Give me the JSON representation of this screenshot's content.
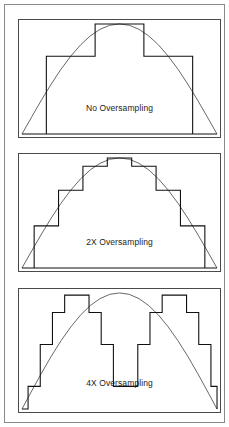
{
  "figure": {
    "background_color": "#ffffff",
    "outer_frame_color": "#8a8a8a",
    "panel_border_color": "#4a4a4a",
    "curve_color": "#555555",
    "staircase_color": "#111111",
    "label_color": "#1c1c1c"
  },
  "panels": [
    {
      "id": "no-oversampling",
      "label": "No Oversampling",
      "steps": 4,
      "step_description": "Coarse 4-step staircase approximating a half-sine arch",
      "chart_data": {
        "type": "area",
        "title": "No Oversampling",
        "xlabel": "",
        "ylabel": "",
        "xlim": [
          0,
          1
        ],
        "ylim": [
          0,
          1
        ],
        "grid": false,
        "legend": "none",
        "curve": {
          "name": "ideal sine arch",
          "x": [
            0.0,
            0.05,
            0.1,
            0.15,
            0.2,
            0.25,
            0.3,
            0.35,
            0.4,
            0.45,
            0.5,
            0.55,
            0.6,
            0.65,
            0.7,
            0.75,
            0.8,
            0.85,
            0.9,
            0.95,
            1.0
          ],
          "y": [
            0.0,
            0.156,
            0.309,
            0.454,
            0.588,
            0.707,
            0.809,
            0.891,
            0.951,
            0.988,
            1.0,
            0.988,
            0.951,
            0.891,
            0.809,
            0.707,
            0.588,
            0.454,
            0.309,
            0.156,
            0.0
          ]
        },
        "staircase": {
          "name": "sampled output",
          "edges": [
            0.0,
            0.125,
            0.375,
            0.625,
            0.875,
            1.0
          ],
          "values": [
            0.0,
            0.707,
            1.0,
            0.707,
            0.0
          ]
        }
      }
    },
    {
      "id": "2x-oversampling",
      "label": "2X Oversampling",
      "steps": 8,
      "step_description": "Eight-step staircase, twice the sample rate",
      "chart_data": {
        "type": "area",
        "title": "2X Oversampling",
        "xlabel": "",
        "ylabel": "",
        "xlim": [
          0,
          1
        ],
        "ylim": [
          0,
          1
        ],
        "grid": false,
        "legend": "none",
        "curve": {
          "name": "ideal sine arch",
          "x": [
            0.0,
            0.05,
            0.1,
            0.15,
            0.2,
            0.25,
            0.3,
            0.35,
            0.4,
            0.45,
            0.5,
            0.55,
            0.6,
            0.65,
            0.7,
            0.75,
            0.8,
            0.85,
            0.9,
            0.95,
            1.0
          ],
          "y": [
            0.0,
            0.156,
            0.309,
            0.454,
            0.588,
            0.707,
            0.809,
            0.891,
            0.951,
            0.988,
            1.0,
            0.988,
            0.951,
            0.891,
            0.809,
            0.707,
            0.588,
            0.454,
            0.309,
            0.156,
            0.0
          ]
        },
        "staircase": {
          "name": "sampled output",
          "edges": [
            0.0,
            0.0625,
            0.1875,
            0.3125,
            0.4375,
            0.5625,
            0.6875,
            0.8125,
            0.9375,
            1.0
          ],
          "values": [
            0.0,
            0.383,
            0.707,
            0.924,
            1.0,
            0.924,
            0.707,
            0.383,
            0.0
          ]
        }
      }
    },
    {
      "id": "4x-oversampling",
      "label": "4X Oversampling",
      "steps": 16,
      "step_description": "Sixteen-step staircase closely tracking the sine arch",
      "chart_data": {
        "type": "area",
        "title": "4X Oversampling",
        "xlabel": "",
        "ylabel": "",
        "xlim": [
          0,
          1
        ],
        "ylim": [
          0,
          1
        ],
        "grid": false,
        "legend": "none",
        "curve": {
          "name": "ideal sine arch",
          "x": [
            0.0,
            0.05,
            0.1,
            0.15,
            0.2,
            0.25,
            0.3,
            0.35,
            0.4,
            0.45,
            0.5,
            0.55,
            0.6,
            0.65,
            0.7,
            0.75,
            0.8,
            0.85,
            0.9,
            0.95,
            1.0
          ],
          "y": [
            0.0,
            0.156,
            0.309,
            0.454,
            0.588,
            0.707,
            0.809,
            0.891,
            0.951,
            0.988,
            1.0,
            0.988,
            0.951,
            0.891,
            0.809,
            0.707,
            0.588,
            0.454,
            0.309,
            0.156,
            0.0
          ]
        },
        "staircase": {
          "name": "sampled output",
          "edges": [
            0.0,
            0.03125,
            0.09375,
            0.15625,
            0.21875,
            0.28125,
            0.34375,
            0.40625,
            0.46875,
            0.53125,
            0.59375,
            0.65625,
            0.71875,
            0.78125,
            0.84375,
            0.90625,
            0.96875,
            1.0
          ],
          "values": [
            0.0,
            0.195,
            0.556,
            0.831,
            0.981,
            0.981,
            0.831,
            0.556,
            0.195,
            0.195,
            0.556,
            0.831,
            0.981,
            0.981,
            0.831,
            0.556,
            0.195,
            0.0
          ]
        }
      }
    }
  ]
}
